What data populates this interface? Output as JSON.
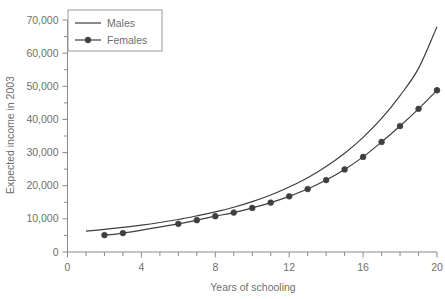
{
  "chart_data": {
    "type": "line",
    "title": "",
    "xlabel": "Years of schooling",
    "ylabel": "Expected income in 2003",
    "xlim": [
      0,
      20
    ],
    "ylim": [
      0,
      70000
    ],
    "grid": false,
    "legend_position": "top-left-inside",
    "x_ticks_major": [
      0,
      4,
      8,
      12,
      16,
      20
    ],
    "x_tick_labels": [
      "0",
      "4",
      "8",
      "12",
      "16",
      "20"
    ],
    "x_ticks_minor_step": 1,
    "y_ticks_major": [
      0,
      10000,
      20000,
      30000,
      40000,
      50000,
      60000,
      70000
    ],
    "y_tick_labels": [
      "0",
      "10,000",
      "20,000",
      "30,000",
      "40,000",
      "50,000",
      "60,000",
      "70,000"
    ],
    "y_ticks_minor_step": 5000,
    "series": [
      {
        "name": "Males",
        "style": "line",
        "markers": false,
        "x": [
          1,
          2,
          3,
          4,
          5,
          6,
          7,
          8,
          9,
          10,
          11,
          12,
          13,
          14,
          15,
          16,
          17,
          18,
          19,
          20
        ],
        "values": [
          6300,
          6800,
          7400,
          8100,
          8900,
          9800,
          10900,
          12100,
          13500,
          15200,
          17200,
          19600,
          22400,
          25800,
          29800,
          34600,
          40300,
          47200,
          55400,
          68000
        ]
      },
      {
        "name": "Females",
        "style": "line",
        "markers": true,
        "x": [
          2,
          3,
          6,
          7,
          8,
          9,
          10,
          11,
          12,
          13,
          14,
          15,
          16,
          17,
          18,
          19,
          20
        ],
        "values": [
          5100,
          5700,
          8500,
          9600,
          10800,
          11900,
          13300,
          14900,
          16800,
          19000,
          21700,
          24900,
          28700,
          33200,
          38000,
          43200,
          48800
        ]
      }
    ]
  },
  "legend": {
    "entries": [
      {
        "label": "Males"
      },
      {
        "label": "Females"
      }
    ]
  },
  "colors": {
    "background": "#ffffff",
    "series_line": "#3f3f3f",
    "axis": "#8a8a8a",
    "text": "#6f6f6f",
    "legend_border": "#9a9a9a"
  }
}
